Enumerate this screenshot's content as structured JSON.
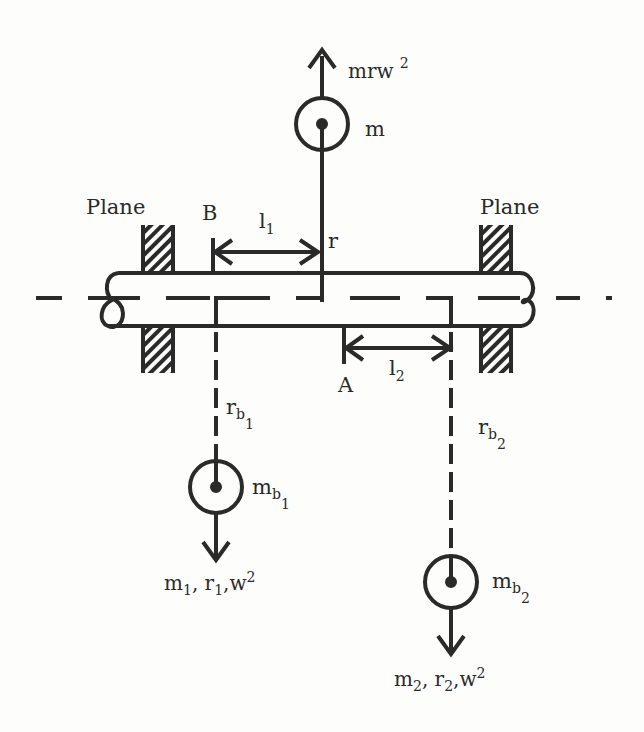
{
  "diagram": {
    "type": "balancing-of-rotating-mass-two-planes",
    "labels": {
      "force_top": "mrw",
      "force_top_exp": "2",
      "mass_top": "m",
      "radius_top": "r",
      "plane_left": "Plane",
      "plane_right": "Plane",
      "point_b": "B",
      "point_a": "A",
      "l1": "l",
      "l1_sub": "1",
      "l2": "l",
      "l2_sub": "2",
      "rb1": "r",
      "rb1_sub": "b",
      "rb1_subsub": "1",
      "rb2": "r",
      "rb2_sub": "b",
      "rb2_subsub": "2",
      "mb1": "m",
      "mb1_sub": "b",
      "mb1_subsub": "1",
      "mb2": "m",
      "mb2_sub": "b",
      "mb2_subsub": "2",
      "force1_m": "m",
      "force1_m_sub": "1",
      "force1_r": ", r",
      "force1_r_sub": "1",
      "force1_w": ",w",
      "force1_w_exp": "2",
      "force2_m": "m",
      "force2_m_sub": "2",
      "force2_r": ", r",
      "force2_r_sub": "2",
      "force2_w": ",w",
      "force2_w_exp": "2"
    },
    "colors": {
      "ink": "#2a2a2a",
      "background": "#fdfdfb"
    }
  }
}
